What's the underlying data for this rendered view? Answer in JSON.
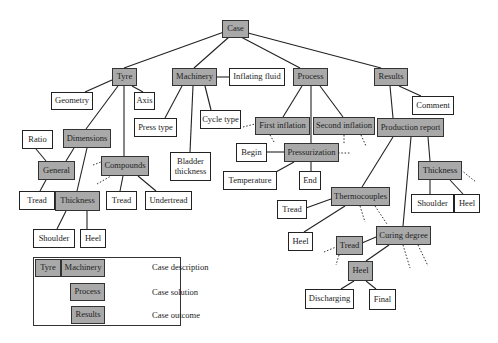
{
  "diagram": {
    "colors": {
      "case_fill": "#a9a9a9",
      "attr_fill": "#ffffff",
      "line": "#222222"
    },
    "nodes": {
      "case": "Case",
      "tyre": "Tyre",
      "machinery": "Machinery",
      "inflating_fluid": "Inflating fluid",
      "process": "Process",
      "results": "Results",
      "geometry": "Geometry",
      "axis": "Axis",
      "press_type": "Press type",
      "cycle_type": "Cycle type",
      "comment": "Comment",
      "ratio": "Ratio",
      "dimensions": "Dimensions",
      "bladder_thickness": "Bladder thickness",
      "first_inflation": "First inflation",
      "second_inflation": "Second inflation",
      "production_report": "Production report",
      "begin": "Begin",
      "pressurization": "Pressurization",
      "general": "General",
      "compounds": "Compounds",
      "thickness_report": "Thickness",
      "temperature": "Temperature",
      "end": "End",
      "tread_general": "Tread",
      "thickness_tyre": "Thickness",
      "tread_compounds": "Tread",
      "undertread": "Undertread",
      "thermocouples": "Thermocouples",
      "shoulder_report": "Shoulder",
      "heel_report": "Heel",
      "tread_thermo": "Tread",
      "shoulder_tyre": "Shoulder",
      "heel_tyre": "Heel",
      "curing_degree": "Curing degree",
      "heel_thermo": "Heel",
      "tread_curing": "Tread",
      "heel_curing": "Heel",
      "discharging": "Discharging",
      "final": "Final"
    },
    "legend": {
      "items": [
        {
          "boxes": [
            "Tyre",
            "Machinery"
          ],
          "label": "Case description"
        },
        {
          "boxes": [
            "Process"
          ],
          "label": "Case solution"
        },
        {
          "boxes": [
            "Results"
          ],
          "label": "Case outcome"
        }
      ]
    }
  }
}
